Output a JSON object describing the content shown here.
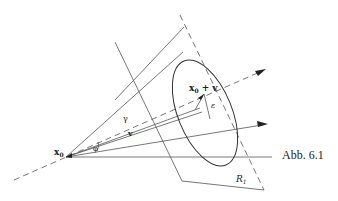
{
  "figure": {
    "caption": "Abb. 6.1",
    "labels": {
      "origin": "x",
      "origin_sub": "0",
      "point": "x",
      "point_sub": "0",
      "point_suffix": " + v",
      "vector": "v",
      "gamma": "γ",
      "phi": "φ",
      "epsilon": "ε",
      "region": "R",
      "region_sub": "1"
    }
  }
}
